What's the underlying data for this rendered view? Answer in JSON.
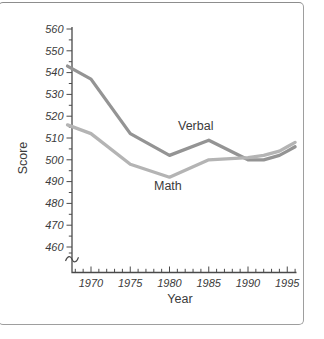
{
  "figure": {
    "background": "#ffffff",
    "frame_color": "#9e9e9e",
    "axis_color": "#4a4a4a",
    "tick_label_color": "#3b3b3b",
    "text_color": "#3b3b3b"
  },
  "chart_data": {
    "type": "line",
    "title": "",
    "xlabel": "Year",
    "ylabel": "Score",
    "x": [
      1967,
      1970,
      1975,
      1980,
      1985,
      1990,
      1992,
      1994,
      1995,
      1996
    ],
    "series": [
      {
        "name": "Verbal",
        "color": "#949494",
        "values": [
          543,
          537,
          512,
          502,
          509,
          500,
          500,
          502,
          504,
          506
        ]
      },
      {
        "name": "Math",
        "color": "#b4b4b4",
        "values": [
          516,
          512,
          498,
          492,
          500,
          501,
          502,
          504,
          506,
          508
        ]
      }
    ],
    "x_tick_labels": [
      1970,
      1975,
      1980,
      1985,
      1990,
      1995
    ],
    "y_tick_labels": [
      460,
      470,
      480,
      490,
      500,
      510,
      520,
      530,
      540,
      550,
      560
    ],
    "x_minor_tick_step_years": 1,
    "y_minor_tick_step": 5,
    "xlim": [
      1967,
      1996.3
    ],
    "ylim_shown": [
      455,
      562
    ],
    "axis_break_on_y": true,
    "grid": false,
    "legend": "inline-labels"
  }
}
